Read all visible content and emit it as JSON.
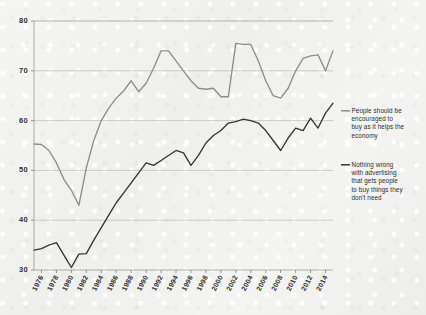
{
  "chart_data": {
    "type": "line",
    "title": "",
    "subtitle": "",
    "xlabel": "",
    "ylabel": "",
    "xlim": [
      1975,
      2015
    ],
    "ylim": [
      30,
      80
    ],
    "grid": true,
    "legend_position": "right",
    "y_ticks": [
      30,
      40,
      50,
      60,
      70,
      80
    ],
    "x_ticks": [
      1976,
      1978,
      1980,
      1982,
      1984,
      1986,
      1988,
      1990,
      1992,
      1994,
      1996,
      1998,
      2000,
      2002,
      2004,
      2006,
      2008,
      2010,
      2012,
      2014
    ],
    "colors": {
      "series_1": "#8d8d8d",
      "series_2": "#353535",
      "gridline": "#b9b9b9",
      "axis": "#9a9a9a",
      "background": "#f3f3f2",
      "text": "#2d2d2d"
    },
    "series": [
      {
        "name": "People should be encouraged to buy as it helps the economy",
        "color": "#8d8d8d",
        "x": [
          1975,
          1976,
          1977,
          1978,
          1979,
          1980,
          1981,
          1982,
          1983,
          1984,
          1985,
          1986,
          1987,
          1988,
          1989,
          1990,
          1991,
          1992,
          1993,
          1994,
          1995,
          1996,
          1997,
          1998,
          1999,
          2000,
          2001,
          2002,
          2003,
          2004,
          2005,
          2006,
          2007,
          2008,
          2009,
          2010,
          2011,
          2012,
          2013,
          2014,
          2015
        ],
        "values": [
          55.3,
          55.2,
          54.0,
          51.5,
          48.2,
          46.0,
          43.0,
          50.5,
          56.0,
          60.0,
          62.5,
          64.5,
          66.0,
          68.0,
          65.8,
          67.5,
          70.5,
          74.0,
          74.0,
          72.0,
          70.0,
          68.0,
          66.5,
          66.3,
          66.5,
          64.8,
          64.8,
          75.5,
          75.3,
          75.3,
          72.0,
          68.0,
          65.0,
          64.5,
          66.5,
          70.0,
          72.5,
          73.0,
          73.2,
          70.0,
          74.0
        ]
      },
      {
        "name": "Nothing wrong with advertising that gets people to buy things they don't need",
        "color": "#353535",
        "x": [
          1975,
          1976,
          1977,
          1978,
          1979,
          1980,
          1981,
          1982,
          1983,
          1984,
          1985,
          1986,
          1987,
          1988,
          1989,
          1990,
          1991,
          1992,
          1993,
          1994,
          1995,
          1996,
          1997,
          1998,
          1999,
          2000,
          2001,
          2002,
          2003,
          2004,
          2005,
          2006,
          2007,
          2008,
          2009,
          2010,
          2011,
          2012,
          2013,
          2014,
          2015
        ],
        "values": [
          34.0,
          34.3,
          35.0,
          35.5,
          33.0,
          30.5,
          33.2,
          33.3,
          36.0,
          38.5,
          41.0,
          43.5,
          45.5,
          47.5,
          49.5,
          51.5,
          51.0,
          52.0,
          53.0,
          54.0,
          53.5,
          51.0,
          53.0,
          55.5,
          57.0,
          58.0,
          59.5,
          59.8,
          60.3,
          60.0,
          59.5,
          58.0,
          56.0,
          54.0,
          56.5,
          58.5,
          58.0,
          60.5,
          58.5,
          61.5,
          63.5
        ]
      }
    ]
  },
  "legend": [
    {
      "id": "legend-series-1",
      "lines": [
        "People should be",
        "encouraged to",
        "buy as it helps the",
        "economy"
      ]
    },
    {
      "id": "legend-series-2",
      "lines": [
        "Nothing wrong",
        "with advertising",
        "that gets people",
        "to buy things they",
        "don't need"
      ]
    }
  ]
}
